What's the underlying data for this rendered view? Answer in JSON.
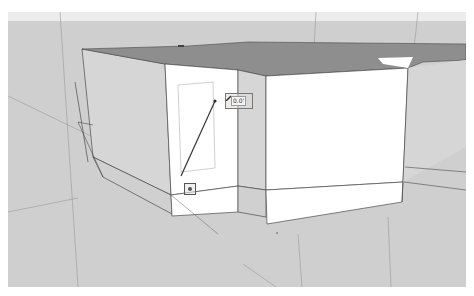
{
  "app": {
    "type": "3d-modeling-viewport"
  },
  "viewport": {
    "background_color": "#cfcfcf",
    "sky_color": "#ececec",
    "model": {
      "top_face_color": "#8e8e8e",
      "front_face_color": "#ffffff",
      "side_face_color": "#d4d4d4",
      "edge_color": "#4a4a4a"
    }
  },
  "tool": {
    "active": "line-tool",
    "cursor_icon": "pencil-icon",
    "tooltip": {
      "label": "0.0'"
    },
    "start_point": {
      "icon": "inference-point-icon"
    },
    "line_color": "#333333"
  }
}
